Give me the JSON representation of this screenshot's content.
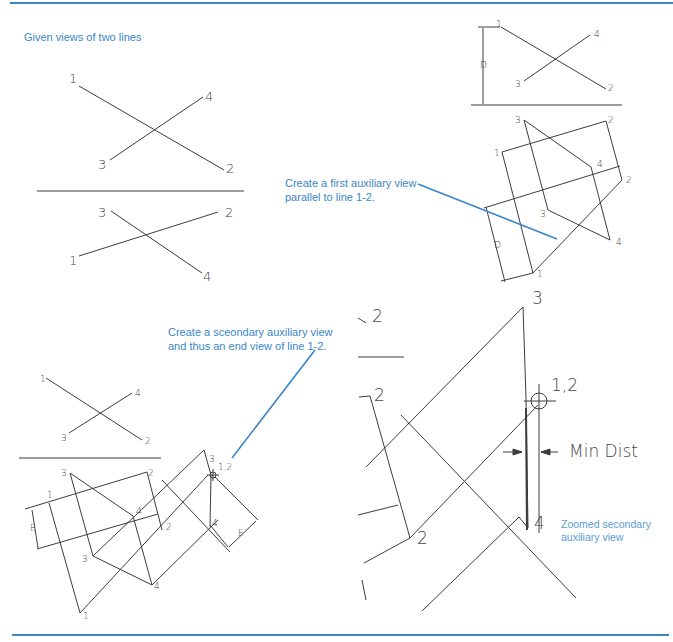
{
  "frame": {
    "accent_color": "#3a86c8",
    "line_color": "#3c3c3c"
  },
  "captions": {
    "given": "Given views of two lines",
    "first_aux_line1": "Create a first auxiliary view",
    "first_aux_line2": "parallel to line 1-2.",
    "second_aux_line1": "Create a sceondary auxiliary view",
    "second_aux_line2": "and thus an end view of line 1-2.",
    "zoomed_line1": "Zoomed secondary",
    "zoomed_line2": "auxiliary view"
  },
  "given_views": {
    "top": {
      "p1": "1",
      "p2": "2",
      "p3": "3",
      "p4": "4"
    },
    "front": {
      "p1": "1",
      "p2": "2",
      "p3": "3",
      "p4": "4"
    }
  },
  "first_aux_panel": {
    "top": {
      "p1": "1",
      "p2": "2",
      "p3": "3",
      "p4": "4",
      "dim": "D"
    },
    "aux": {
      "p1a": "1",
      "p2a": "2",
      "p3a": "3",
      "p4a": "4",
      "p1b": "1",
      "p2b": "2",
      "p3b": "3",
      "p4b": "4",
      "dim": "D"
    }
  },
  "second_aux_panel": {
    "top": {
      "p1": "1",
      "p2": "2",
      "p3": "3",
      "p4": "4"
    },
    "first_aux": {
      "p1a": "1",
      "p2a": "2",
      "p3a": "3",
      "p4a": "4",
      "p1b": "1",
      "p2b": "2",
      "p3b": "3",
      "p4b": "4",
      "dim": "E"
    },
    "second_aux": {
      "p3": "3",
      "p12": "1,2",
      "p4": "4",
      "dim": "E"
    }
  },
  "zoomed_view": {
    "p2_top": "2",
    "p2_mid": "2",
    "p2_low": "2",
    "p3": "3",
    "p12": "1,2",
    "p4": "4",
    "min_dist": "Min Dist"
  }
}
